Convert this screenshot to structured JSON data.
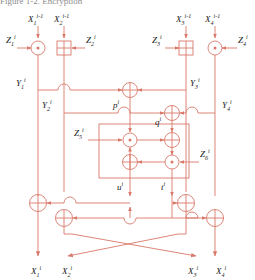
{
  "figure": {
    "title_fragment": "Figure 1-2.  Encryption",
    "domain": "cryptography-block-cipher-round",
    "line_color": "#d9786a",
    "label_color": "#1a1a1a",
    "background": "#ffffff"
  },
  "inputs": [
    {
      "id": "x1in",
      "base": "X",
      "sub": "1",
      "sup": "i-1"
    },
    {
      "id": "x2in",
      "base": "X",
      "sub": "2",
      "sup": "i-1"
    },
    {
      "id": "x3in",
      "base": "X",
      "sub": "3",
      "sup": "i-1"
    },
    {
      "id": "x4in",
      "base": "X",
      "sub": "4",
      "sup": "i-1"
    }
  ],
  "subkeys": [
    {
      "id": "z1",
      "base": "Z",
      "sub": "1",
      "sup": "i"
    },
    {
      "id": "z2",
      "base": "Z",
      "sub": "2",
      "sup": "i"
    },
    {
      "id": "z3",
      "base": "Z",
      "sub": "3",
      "sup": "i"
    },
    {
      "id": "z4",
      "base": "Z",
      "sub": "4",
      "sup": "i"
    },
    {
      "id": "z5",
      "base": "Z",
      "sub": "5",
      "sup": "i"
    },
    {
      "id": "z6",
      "base": "Z",
      "sub": "6",
      "sup": "i"
    }
  ],
  "intermediates": [
    {
      "id": "y1",
      "base": "Y",
      "sub": "1",
      "sup": "i"
    },
    {
      "id": "y2",
      "base": "Y",
      "sub": "2",
      "sup": "i"
    },
    {
      "id": "y3",
      "base": "Y",
      "sub": "3",
      "sup": "i"
    },
    {
      "id": "y4",
      "base": "Y",
      "sub": "4",
      "sup": "i"
    },
    {
      "id": "p",
      "base": "p",
      "sub": "",
      "sup": "i"
    },
    {
      "id": "q",
      "base": "q",
      "sub": "",
      "sup": "i"
    },
    {
      "id": "u",
      "base": "u",
      "sub": "",
      "sup": "i"
    },
    {
      "id": "t",
      "base": "t",
      "sub": "",
      "sup": "i"
    }
  ],
  "outputs": [
    {
      "id": "x1out",
      "base": "X",
      "sub": "1",
      "sup": "i"
    },
    {
      "id": "x2out",
      "base": "X",
      "sub": "2",
      "sup": "i"
    },
    {
      "id": "x3out",
      "base": "X",
      "sub": "3",
      "sup": "i"
    },
    {
      "id": "x4out",
      "base": "X",
      "sub": "4",
      "sup": "i"
    }
  ],
  "operators": [
    {
      "id": "op-mul-1",
      "glyph": "circle-dot",
      "name": "multiply-mod-2-16-plus-1"
    },
    {
      "id": "op-add-2",
      "glyph": "square-plus",
      "name": "add-mod-2-16"
    },
    {
      "id": "op-add-3",
      "glyph": "square-plus",
      "name": "add-mod-2-16"
    },
    {
      "id": "op-mul-4",
      "glyph": "circle-dot",
      "name": "multiply-mod-2-16-plus-1"
    },
    {
      "id": "op-xor-p",
      "glyph": "circle-plus",
      "name": "xor"
    },
    {
      "id": "op-xor-q",
      "glyph": "circle-plus",
      "name": "xor"
    },
    {
      "id": "op-mul-z5",
      "glyph": "circle-dot",
      "name": "multiply-mod-2-16-plus-1"
    },
    {
      "id": "op-xor-ma",
      "glyph": "circle-plus",
      "name": "xor"
    },
    {
      "id": "op-add-ma",
      "glyph": "circle-plus",
      "name": "add-mod-2-16"
    },
    {
      "id": "op-mul-z6",
      "glyph": "circle-dot",
      "name": "multiply-mod-2-16-plus-1"
    },
    {
      "id": "op-xor-o1",
      "glyph": "circle-plus",
      "name": "xor"
    },
    {
      "id": "op-xor-o2",
      "glyph": "circle-plus",
      "name": "xor"
    },
    {
      "id": "op-xor-o3",
      "glyph": "circle-plus",
      "name": "xor"
    },
    {
      "id": "op-xor-o4",
      "glyph": "circle-plus",
      "name": "xor"
    }
  ],
  "ma_box": {
    "name": "multiplication-addition-structure"
  }
}
